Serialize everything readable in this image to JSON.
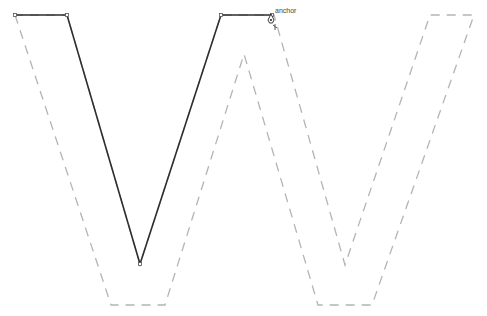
{
  "diagram": {
    "anchor_label": "anchor",
    "colors": {
      "path": "#2e2e2e",
      "outline": "#b4b4b4"
    },
    "solid_path": {
      "name": "drawn-stroke",
      "points": [
        [
          15,
          15
        ],
        [
          67,
          15
        ],
        [
          140,
          264
        ],
        [
          221,
          15
        ],
        [
          272,
          15
        ]
      ]
    },
    "outline_path": {
      "name": "letter-w-guide",
      "points": [
        [
          15,
          15
        ],
        [
          111,
          305
        ],
        [
          165,
          305
        ],
        [
          244,
          54
        ],
        [
          318,
          305
        ],
        [
          372,
          305
        ],
        [
          474,
          15
        ],
        [
          430,
          15
        ],
        [
          345,
          265
        ],
        [
          274,
          15
        ],
        [
          221,
          15
        ],
        [
          140,
          264
        ],
        [
          67,
          15
        ],
        [
          15,
          15
        ]
      ]
    }
  }
}
